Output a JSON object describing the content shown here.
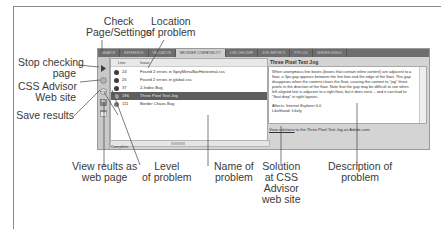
{
  "panel": {
    "tabs": [
      {
        "label": "SEARCH",
        "active": false
      },
      {
        "label": "REFERENCE",
        "active": false
      },
      {
        "label": "VALIDATION",
        "active": false
      },
      {
        "label": "BROWSER COMPATIBILITY",
        "active": true
      },
      {
        "label": "LINK CHECKER",
        "active": false
      },
      {
        "label": "SITE REPORTS",
        "active": false
      },
      {
        "label": "FTP LOG",
        "active": false
      },
      {
        "label": "SERVER DEBUG",
        "active": false
      }
    ],
    "toolbar": [
      {
        "name": "check-page-settings",
        "icon": "play-triangle"
      },
      {
        "name": "stop-checking",
        "icon": "stop-circle"
      },
      {
        "name": "css-advisor",
        "icon": "globe"
      },
      {
        "name": "save-results",
        "icon": "disk"
      },
      {
        "name": "view-results-web",
        "icon": "browser"
      }
    ],
    "list": {
      "columns": [
        "Line",
        "Issue"
      ],
      "rows": [
        {
          "line": "24",
          "issue": "Found 2 errors in SpryMenuBarHorizontal.css",
          "level": "error",
          "selected": false
        },
        {
          "line": "25",
          "issue": "Found 2 errors in global.css",
          "level": "error",
          "selected": false
        },
        {
          "line": "37",
          "issue": "2-Index Bug",
          "level": "warning",
          "selected": false
        },
        {
          "line": "186",
          "issue": "Three Pixel Text Jog",
          "level": "warning",
          "selected": true
        },
        {
          "line": "111",
          "issue": "Border Chaos Bug",
          "level": "info",
          "selected": false
        }
      ]
    },
    "status": "Complete.",
    "detail": {
      "title": "Three Pixel Text Jog",
      "description": "When anonymous line boxes (boxes that contain inline content) are adjacent to a float, a 3px gap appears between the line box and the edge of the float. This gap disappears when the content clears the float, causing the content to \"jog\" three pixels in the direction of the float. Note that the gap may be difficult to see when left-aligned text is adjacent to a right float, but it does exist -- and it can lead to \"float drop\" in right layouts.",
      "affects": "Affects: Internet Explorer 6.0",
      "likelihood": "Likelihood: Likely",
      "link_prefix": "View solutions",
      "link_suffix": " to the Three Pixel Text Jog on Adobe.com."
    }
  },
  "callouts": {
    "check_page": "Check\nPage/Settings",
    "location": "Location\nof problem",
    "stop_checking": "Stop checking\npage",
    "css_advisor": "CSS Advisor\nWeb site",
    "save_results": "Save results",
    "view_results": "View reults as\nweb page",
    "level": "Level\nof problem",
    "name": "Name of\nproblem",
    "solution": "Solution\nat CSS\nAdvisor\nweb site",
    "description": "Description of\nproblem"
  },
  "colors": {
    "tabbar": "#6e6e6e",
    "active_tab": "#cfcfcf",
    "selected_row": "#5e5e5e",
    "panel_bg": "#d4d4d4"
  }
}
